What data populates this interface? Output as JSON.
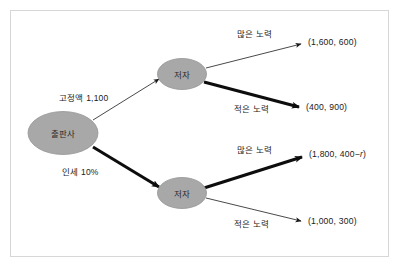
{
  "diagram": {
    "type": "extensive-form-game-tree",
    "frame": {
      "visible": true,
      "border_color": "#d7d7d7"
    },
    "node_fill": "#a8a8a8",
    "node_stroke": "#8f8f8f",
    "nodes": [
      {
        "id": "publisher",
        "label": "출판사",
        "role": "root-player"
      },
      {
        "id": "author-top",
        "label": "저자",
        "role": "player"
      },
      {
        "id": "author-bottom",
        "label": "저자",
        "role": "player"
      }
    ],
    "edges": [
      {
        "id": "contract-fixed",
        "label": "고정액 1,100",
        "from": "publisher",
        "to": "author-top",
        "emphasis": "thin"
      },
      {
        "id": "contract-royalty",
        "label": "인세 10%",
        "from": "publisher",
        "to": "author-bottom",
        "emphasis": "bold"
      },
      {
        "id": "top-high-effort",
        "label": "많은 노력",
        "from": "author-top",
        "to": "payoff-1",
        "emphasis": "thin"
      },
      {
        "id": "top-low-effort",
        "label": "적은 노력",
        "from": "author-top",
        "to": "payoff-2",
        "emphasis": "bold"
      },
      {
        "id": "bottom-high-effort",
        "label": "많은 노력",
        "from": "author-bottom",
        "to": "payoff-3",
        "emphasis": "bold"
      },
      {
        "id": "bottom-low-effort",
        "label": "적은 노력",
        "from": "author-bottom",
        "to": "payoff-4",
        "emphasis": "thin"
      }
    ],
    "payoffs": [
      {
        "id": "payoff-1",
        "text": "(1,600, 600)",
        "prefix": "(1,600, 600)",
        "variable": "",
        "suffix": ""
      },
      {
        "id": "payoff-2",
        "text": "(400, 900)",
        "prefix": "(400, 900)",
        "variable": "",
        "suffix": ""
      },
      {
        "id": "payoff-3",
        "text": "(1,800, 400−r)",
        "prefix": "(1,800, 400−",
        "variable": "r",
        "suffix": ")"
      },
      {
        "id": "payoff-4",
        "text": "(1,000, 300)",
        "prefix": "(1,000, 300)",
        "variable": "",
        "suffix": ""
      }
    ]
  }
}
